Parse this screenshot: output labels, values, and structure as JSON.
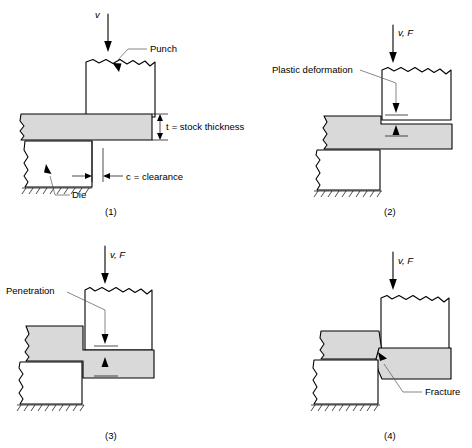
{
  "figure": {
    "material_color": "#d9d9d9",
    "line_color": "#000000",
    "leader_color": "#555555",
    "background": "#ffffff"
  },
  "panels": [
    {
      "id": "1",
      "caption": "(1)",
      "force_label": "v",
      "labels": {
        "punch": "Punch",
        "die": "Die",
        "thickness": "t = stock thickness",
        "thickness_symbol": "t",
        "thickness_text": "= stock thickness",
        "clearance": "c = clearance",
        "clearance_symbol": "c",
        "clearance_text": "= clearance"
      }
    },
    {
      "id": "2",
      "caption": "(2)",
      "force_label": "v, F",
      "labels": {
        "callout": "Plastic deformation"
      }
    },
    {
      "id": "3",
      "caption": "(3)",
      "force_label": "v, F",
      "labels": {
        "callout": "Penetration"
      }
    },
    {
      "id": "4",
      "caption": "(4)",
      "force_label": "v, F",
      "labels": {
        "callout": "Fracture"
      }
    }
  ]
}
